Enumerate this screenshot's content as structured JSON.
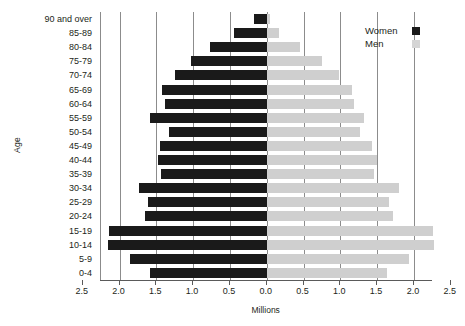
{
  "chart_data": {
    "type": "bar",
    "subtype": "population-pyramid",
    "title": "",
    "xlabel": "Millions",
    "ylabel": "Age",
    "grid": true,
    "legend_position": "top-right",
    "xlim": [
      -2.5,
      2.5
    ],
    "xticks": [
      2.5,
      2.0,
      1.5,
      1.0,
      0.5,
      0.0,
      0.5,
      1.0,
      1.5,
      2.0,
      2.5
    ],
    "xtick_labels": [
      "2.5",
      "2.0",
      "1.5",
      "1.0",
      "0.5",
      "0.0",
      "0.5",
      "1.0",
      "1.5",
      "2.0",
      "2.5"
    ],
    "categories": [
      "90 and over",
      "85-89",
      "80-84",
      "75-79",
      "70-74",
      "65-69",
      "60-64",
      "55-59",
      "50-54",
      "45-49",
      "40-44",
      "35-39",
      "30-34",
      "25-29",
      "20-24",
      "15-19",
      "10-14",
      "5-9",
      "0-4"
    ],
    "series": [
      {
        "name": "Women",
        "side": "left",
        "color": "#1a1a1a",
        "values": [
          0.17,
          0.45,
          0.77,
          1.03,
          1.24,
          1.42,
          1.38,
          1.58,
          1.33,
          1.45,
          1.48,
          1.44,
          1.73,
          1.61,
          1.66,
          2.14,
          2.15,
          1.86,
          1.58
        ]
      },
      {
        "name": "Men",
        "side": "right",
        "color": "#cfcfcf",
        "values": [
          0.04,
          0.17,
          0.45,
          0.75,
          0.98,
          1.16,
          1.19,
          1.32,
          1.27,
          1.43,
          1.5,
          1.46,
          1.8,
          1.66,
          1.72,
          2.26,
          2.27,
          1.94,
          1.64
        ]
      }
    ]
  },
  "legend": {
    "items": [
      {
        "label": "Women",
        "color": "#1a1a1a"
      },
      {
        "label": "Men",
        "color": "#d5d5d5"
      }
    ]
  }
}
